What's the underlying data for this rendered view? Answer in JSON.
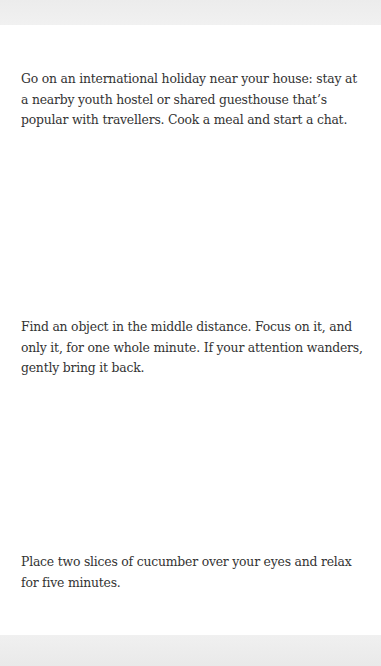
{
  "tips": [
    {
      "text": "Go on an international holiday near your house: stay at a nearby youth hostel or shared guesthouse that’s popular with travellers. Cook a meal and start a chat."
    },
    {
      "text": "Find an object in the middle distance. Focus on it, and only it, for one whole minute. If your attention wanders, gently bring it back."
    },
    {
      "text": "Place two slices of cucumber over your eyes and relax for five minutes."
    }
  ],
  "colors": {
    "text": "#333333",
    "band": "#ececec",
    "background": "#ffffff"
  }
}
